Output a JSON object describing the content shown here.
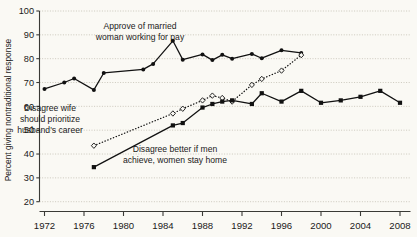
{
  "chart_data": {
    "type": "line",
    "title": "",
    "xlabel": "",
    "ylabel": "Percent giving nontraditional response",
    "xlim": [
      1971,
      2009
    ],
    "ylim": [
      20,
      100
    ],
    "ytick_labels": [
      "20",
      "30",
      "40",
      "50",
      "60",
      "70",
      "80",
      "90",
      "100"
    ],
    "yticks": [
      20,
      30,
      40,
      50,
      60,
      70,
      80,
      90,
      100
    ],
    "xtick_labels": [
      "1972",
      "1976",
      "1980",
      "1984",
      "1988",
      "1992",
      "1996",
      "2000",
      "2004",
      "2008"
    ],
    "xticks": [
      1972,
      1976,
      1980,
      1984,
      1988,
      1992,
      1996,
      2000,
      2004,
      2008
    ],
    "grid": true,
    "legend_position": "inline-annotations",
    "series": [
      {
        "name": "Approve of married woman working for pay",
        "marker": "filled-circle",
        "line": "solid",
        "color": "#111111",
        "points": [
          {
            "x": 1972,
            "y": 67.3
          },
          {
            "x": 1974,
            "y": 70.0
          },
          {
            "x": 1975,
            "y": 71.7
          },
          {
            "x": 1977,
            "y": 66.9
          },
          {
            "x": 1978,
            "y": 74.0
          },
          {
            "x": 1982,
            "y": 75.5
          },
          {
            "x": 1983,
            "y": 77.8
          },
          {
            "x": 1985,
            "y": 87.5
          },
          {
            "x": 1986,
            "y": 79.6
          },
          {
            "x": 1988,
            "y": 81.8
          },
          {
            "x": 1989,
            "y": 79.4
          },
          {
            "x": 1990,
            "y": 81.6
          },
          {
            "x": 1991,
            "y": 80.0
          },
          {
            "x": 1993,
            "y": 82.0
          },
          {
            "x": 1994,
            "y": 80.2
          },
          {
            "x": 1996,
            "y": 83.5
          },
          {
            "x": 1998,
            "y": 82.4
          }
        ]
      },
      {
        "name": "Disagree wife should prioritize husband's career",
        "marker": "open-diamond",
        "line": "dotted",
        "color": "#111111",
        "points": [
          {
            "x": 1977,
            "y": 43.5
          },
          {
            "x": 1985,
            "y": 57.0
          },
          {
            "x": 1986,
            "y": 59.0
          },
          {
            "x": 1988,
            "y": 62.5
          },
          {
            "x": 1989,
            "y": 64.5
          },
          {
            "x": 1990,
            "y": 63.5
          },
          {
            "x": 1991,
            "y": 62.0
          },
          {
            "x": 1993,
            "y": 69.0
          },
          {
            "x": 1994,
            "y": 71.5
          },
          {
            "x": 1996,
            "y": 75.0
          },
          {
            "x": 1998,
            "y": 81.5
          }
        ]
      },
      {
        "name": "Disagree better if men achieve, women stay home",
        "marker": "filled-square",
        "line": "solid",
        "color": "#111111",
        "points": [
          {
            "x": 1977,
            "y": 34.5
          },
          {
            "x": 1985,
            "y": 52.0
          },
          {
            "x": 1986,
            "y": 53.0
          },
          {
            "x": 1988,
            "y": 59.5
          },
          {
            "x": 1989,
            "y": 61.0
          },
          {
            "x": 1990,
            "y": 62.0
          },
          {
            "x": 1991,
            "y": 62.5
          },
          {
            "x": 1993,
            "y": 61.0
          },
          {
            "x": 1994,
            "y": 65.5
          },
          {
            "x": 1996,
            "y": 62.0
          },
          {
            "x": 1998,
            "y": 66.5
          },
          {
            "x": 2000,
            "y": 61.5
          },
          {
            "x": 2002,
            "y": 62.5
          },
          {
            "x": 2004,
            "y": 64.0
          },
          {
            "x": 2006,
            "y": 66.5
          },
          {
            "x": 2008,
            "y": 61.5
          }
        ]
      }
    ],
    "annotations": [
      {
        "id": "approve",
        "lines": [
          "Approve of married",
          "woman working for pay"
        ],
        "x": 140,
        "y": 29
      },
      {
        "id": "prioritize",
        "lines": [
          "Disagree wife",
          "should prioritize",
          "husband's career"
        ],
        "x": 50,
        "y": 111
      },
      {
        "id": "achieve",
        "lines": [
          "Disagree better if men",
          "achieve, women stay home"
        ],
        "x": 175,
        "y": 152
      }
    ]
  }
}
